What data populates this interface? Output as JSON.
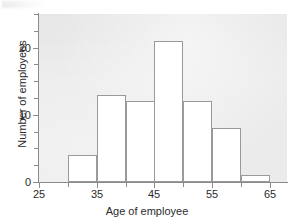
{
  "chart_data": {
    "type": "bar",
    "title": "",
    "subtitle": "",
    "xlabel": "Age of employee",
    "ylabel": "Number of employees",
    "xlim": [
      25,
      68
    ],
    "ylim": [
      0,
      25
    ],
    "grid": false,
    "legend": null,
    "bin_width": 5,
    "bin_edges": [
      30,
      35,
      40,
      45,
      50,
      55,
      60,
      65
    ],
    "categories": [
      "30-35",
      "35-40",
      "40-45",
      "45-50",
      "50-55",
      "55-60",
      "60-65"
    ],
    "values": [
      4,
      13,
      12,
      21,
      12,
      8,
      1
    ],
    "bars": [
      {
        "label": "30-35",
        "start": 30,
        "end": 35,
        "value": 4
      },
      {
        "label": "35-40",
        "start": 35,
        "end": 40,
        "value": 13
      },
      {
        "label": "40-45",
        "start": 40,
        "end": 45,
        "value": 12
      },
      {
        "label": "45-50",
        "start": 45,
        "end": 50,
        "value": 21
      },
      {
        "label": "50-55",
        "start": 50,
        "end": 55,
        "value": 12
      },
      {
        "label": "55-60",
        "start": 55,
        "end": 60,
        "value": 8
      },
      {
        "label": "60-65",
        "start": 60,
        "end": 65,
        "value": 1
      }
    ],
    "x_ticks_major": [
      25,
      35,
      45,
      55,
      65
    ],
    "x_ticks_minor": [
      30,
      40,
      50,
      60
    ],
    "x_tick_labels": [
      "25",
      "35",
      "45",
      "55",
      "65"
    ],
    "y_ticks_major": [
      0,
      10,
      20
    ],
    "y_ticks_minor": [
      2.5,
      5,
      7.5,
      12.5,
      15,
      17.5,
      22.5,
      25
    ],
    "y_tick_labels": [
      "0",
      "10",
      "20"
    ],
    "colors": {
      "bar_fill": "#ffffff",
      "bar_stroke": "#9a9a9a",
      "panel_background": "#ebebeb",
      "axis": "#8b8b8b",
      "text": "#2b2b2b",
      "figure_background": "#ffffff"
    }
  }
}
